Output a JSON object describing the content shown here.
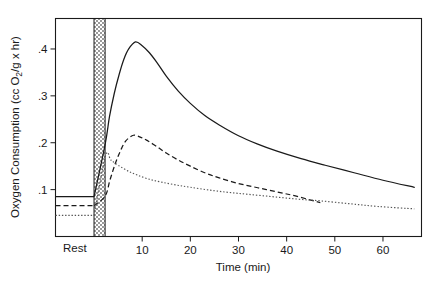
{
  "figure": {
    "name": "oxygen-consumption-recovery-chart",
    "background": "#ffffff",
    "ink": "#1a1a1a"
  },
  "chart_data": {
    "type": "line",
    "title": "",
    "subtitle": "",
    "xlabel": "Time  (min)",
    "ylabel": "Oxygen Consumption  (cc O₂/g x hr)",
    "xlim": [
      -8,
      68
    ],
    "ylim": [
      0,
      0.465
    ],
    "grid": false,
    "legend_position": "none",
    "x_ticks": [
      10,
      20,
      30,
      40,
      50,
      60
    ],
    "x_tick_labels": [
      "10",
      "20",
      "30",
      "40",
      "50",
      "60"
    ],
    "y_ticks": [
      0.1,
      0.2,
      0.3,
      0.4
    ],
    "y_tick_labels": [
      ".1",
      ".2",
      ".3",
      ".4"
    ],
    "rest_region": {
      "label": "Rest",
      "x_start": -8,
      "x_end": 0,
      "baselines": [
        {
          "series": "solid",
          "value": 0.085
        },
        {
          "series": "dashed",
          "value": 0.066
        },
        {
          "series": "dotted",
          "value": 0.045
        }
      ]
    },
    "exercise_band": {
      "label": "",
      "x_start": 0,
      "x_end": 2.3,
      "fill": "hatched-gray"
    },
    "series": [
      {
        "name": "solid",
        "style": "solid",
        "color": "#1a1a1a",
        "rest_value": 0.085,
        "peak": {
          "x": 8.6,
          "y": 0.415
        },
        "end": {
          "x": 66.5,
          "y": 0.105
        },
        "x": [
          2.3,
          3.2,
          4.2,
          5.2,
          6.2,
          7.2,
          8.6,
          10.0,
          11.5,
          13.0,
          15.0,
          17.5,
          20.0,
          23.0,
          26.0,
          30.0,
          34.0,
          38.0,
          43.0,
          48.0,
          54.0,
          60.0,
          66.5
        ],
        "values": [
          0.196,
          0.255,
          0.305,
          0.345,
          0.378,
          0.4,
          0.415,
          0.407,
          0.392,
          0.372,
          0.342,
          0.31,
          0.284,
          0.258,
          0.238,
          0.215,
          0.197,
          0.182,
          0.166,
          0.152,
          0.136,
          0.12,
          0.105
        ]
      },
      {
        "name": "dashed",
        "style": "dashed",
        "color": "#1a1a1a",
        "rest_value": 0.066,
        "peak": {
          "x": 8.2,
          "y": 0.216
        },
        "end": {
          "x": 47.0,
          "y": 0.072
        },
        "x": [
          2.3,
          3.3,
          4.4,
          5.5,
          6.6,
          8.2,
          9.6,
          11.0,
          13.0,
          15.0,
          17.5,
          20.0,
          23.0,
          26.0,
          30.0,
          34.0,
          38.0,
          42.0,
          47.0
        ],
        "values": [
          0.086,
          0.12,
          0.155,
          0.183,
          0.204,
          0.216,
          0.212,
          0.205,
          0.192,
          0.178,
          0.163,
          0.15,
          0.136,
          0.125,
          0.113,
          0.104,
          0.095,
          0.086,
          0.072
        ]
      },
      {
        "name": "dotted",
        "style": "dotted",
        "color": "#555555",
        "rest_value": 0.045,
        "peak": {
          "x": 2.4,
          "y": 0.172
        },
        "end": {
          "x": 66.5,
          "y": 0.059
        },
        "x": [
          2.4,
          3.5,
          5.0,
          7.0,
          9.0,
          11.5,
          14.0,
          17.0,
          20.0,
          24.0,
          28.0,
          32.0,
          37.0,
          42.0,
          47.0,
          53.0,
          59.0,
          66.5
        ],
        "values": [
          0.172,
          0.163,
          0.152,
          0.14,
          0.131,
          0.122,
          0.116,
          0.11,
          0.105,
          0.099,
          0.094,
          0.09,
          0.085,
          0.08,
          0.076,
          0.07,
          0.064,
          0.059
        ]
      }
    ]
  }
}
